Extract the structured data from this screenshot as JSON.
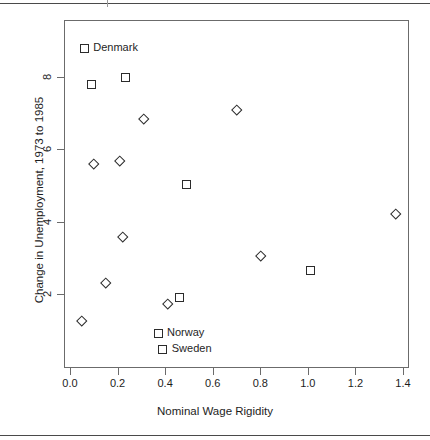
{
  "chart_data": {
    "type": "scatter",
    "title": "",
    "xlabel": "Nominal Wage Rigidity",
    "ylabel": "Change in Unemployment, 1973 to 1985",
    "xlim": [
      -0.025,
      1.425
    ],
    "ylim": [
      0.26,
      9.35
    ],
    "xticks": [
      "0.0",
      "0.2",
      "0.4",
      "0.6",
      "0.8",
      "1.0",
      "1.2",
      "1.4"
    ],
    "xtick_values": [
      0.0,
      0.2,
      0.4,
      0.6,
      0.8,
      1.0,
      1.2,
      1.4
    ],
    "yticks": [
      "2",
      "4",
      "6",
      "8"
    ],
    "ytick_values": [
      2,
      4,
      6,
      8
    ],
    "grid": false,
    "legend": "none",
    "marker_shapes": [
      "square",
      "diamond"
    ],
    "marker_color": "#2b2b2b",
    "points": [
      {
        "x": 0.06,
        "y": 8.8,
        "shape": "square",
        "label": "Denmark"
      },
      {
        "x": 0.09,
        "y": 7.78,
        "shape": "square",
        "label": ""
      },
      {
        "x": 0.235,
        "y": 7.98,
        "shape": "square",
        "label": ""
      },
      {
        "x": 0.31,
        "y": 6.85,
        "shape": "diamond",
        "label": ""
      },
      {
        "x": 0.7,
        "y": 7.1,
        "shape": "diamond",
        "label": ""
      },
      {
        "x": 0.1,
        "y": 5.6,
        "shape": "diamond",
        "label": ""
      },
      {
        "x": 0.21,
        "y": 5.68,
        "shape": "diamond",
        "label": ""
      },
      {
        "x": 0.49,
        "y": 5.02,
        "shape": "square",
        "label": ""
      },
      {
        "x": 1.37,
        "y": 4.22,
        "shape": "diamond",
        "label": ""
      },
      {
        "x": 0.22,
        "y": 3.58,
        "shape": "diamond",
        "label": ""
      },
      {
        "x": 0.8,
        "y": 3.05,
        "shape": "diamond",
        "label": ""
      },
      {
        "x": 1.01,
        "y": 2.65,
        "shape": "square",
        "label": ""
      },
      {
        "x": 0.15,
        "y": 2.32,
        "shape": "diamond",
        "label": ""
      },
      {
        "x": 0.46,
        "y": 1.9,
        "shape": "square",
        "label": ""
      },
      {
        "x": 0.41,
        "y": 1.72,
        "shape": "diamond",
        "label": ""
      },
      {
        "x": 0.05,
        "y": 1.26,
        "shape": "diamond",
        "label": ""
      },
      {
        "x": 0.37,
        "y": 0.92,
        "shape": "square",
        "label": "Norway"
      },
      {
        "x": 0.39,
        "y": 0.47,
        "shape": "square",
        "label": "Sweden"
      }
    ]
  }
}
